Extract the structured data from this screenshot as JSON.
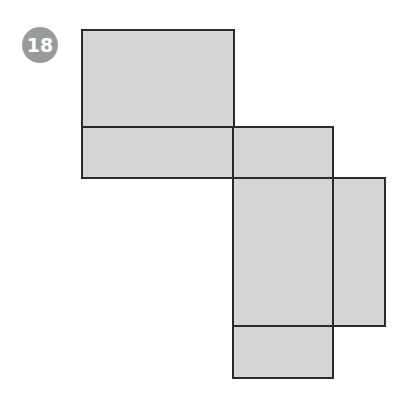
{
  "figure": {
    "number": "18",
    "colors": {
      "fill": "#d6d6d6",
      "stroke": "#2a2a2a",
      "badge": "#9a9a9a"
    },
    "faces": [
      {
        "name": "top-face",
        "x": 82,
        "y": 30,
        "w": 152,
        "h": 97
      },
      {
        "name": "left-strip",
        "x": 82,
        "y": 127,
        "w": 152,
        "h": 51
      },
      {
        "name": "middle-top",
        "x": 233,
        "y": 127,
        "w": 100,
        "h": 51
      },
      {
        "name": "middle-large",
        "x": 233,
        "y": 178,
        "w": 100,
        "h": 148
      },
      {
        "name": "right-side",
        "x": 333,
        "y": 178,
        "w": 52,
        "h": 148
      },
      {
        "name": "bottom-face",
        "x": 233,
        "y": 326,
        "w": 100,
        "h": 52
      }
    ]
  }
}
